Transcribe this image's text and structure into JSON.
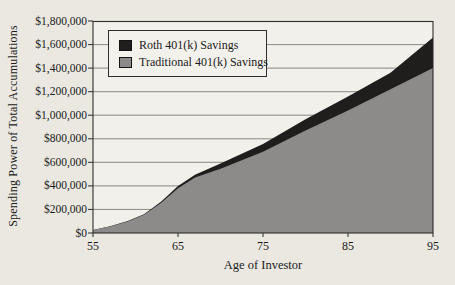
{
  "figure": {
    "background": "#eae8e1",
    "plot_background": "#f2f0ea",
    "text_color": "#1b1b1b"
  },
  "chart_data": {
    "type": "area",
    "title": "",
    "xlabel": "Age of Investor",
    "ylabel": "Spending Power of Total Accumulations",
    "xlim": [
      55,
      95
    ],
    "ylim": [
      0,
      1800000
    ],
    "grid": true,
    "legend_position": "top-left",
    "x_ticks": [
      55,
      65,
      75,
      85,
      95
    ],
    "y_tick_step": 200000,
    "y_tick_labels": [
      "$0",
      "$200,000",
      "$400,000",
      "$600,000",
      "$800,000",
      "$1,000,000",
      "$1,200,000",
      "$1,400,000",
      "$1,600,000",
      "$1,800,000"
    ],
    "x": [
      55,
      57,
      59,
      61,
      63,
      65,
      67,
      70,
      75,
      80,
      85,
      90,
      95
    ],
    "series": [
      {
        "name": "Roth 401(k) Savings",
        "color": "#201e1c",
        "values": [
          25000,
          57000,
          100000,
          160000,
          265000,
          400000,
          495000,
          590000,
          755000,
          965000,
          1160000,
          1360000,
          1660000
        ]
      },
      {
        "name": "Traditional 401(k) Savings",
        "color": "#8c8b89",
        "values": [
          25000,
          55000,
          95000,
          155000,
          255000,
          380000,
          470000,
          545000,
          690000,
          870000,
          1040000,
          1220000,
          1400000
        ]
      }
    ]
  }
}
